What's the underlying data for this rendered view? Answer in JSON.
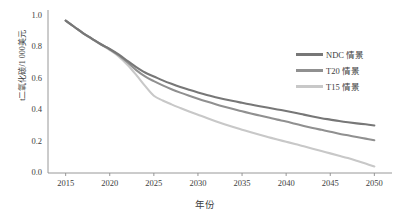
{
  "chart_data": {
    "type": "line",
    "title": "",
    "xlabel": "年份",
    "ylabel": "t二氧化碳/1 000美元",
    "xlim": [
      2013,
      2052
    ],
    "ylim": [
      0.0,
      1.0
    ],
    "grid": false,
    "legend_position": "upper-right",
    "x_ticks": [
      "2015",
      "2020",
      "2025",
      "2030",
      "2035",
      "2040",
      "2045",
      "2050"
    ],
    "y_ticks": [
      "0.0",
      "0.2",
      "0.4",
      "0.6",
      "0.8",
      "1.0"
    ],
    "x": [
      2015,
      2016,
      2017,
      2018,
      2019,
      2020,
      2021,
      2022,
      2023,
      2024,
      2025,
      2026,
      2027,
      2028,
      2029,
      2030,
      2031,
      2032,
      2033,
      2034,
      2035,
      2036,
      2037,
      2038,
      2039,
      2040,
      2041,
      2042,
      2043,
      2044,
      2045,
      2046,
      2047,
      2048,
      2049,
      2050
    ],
    "series": [
      {
        "name": "NDC 情景",
        "color": "#777777",
        "values": [
          0.97,
          0.93,
          0.89,
          0.855,
          0.82,
          0.79,
          0.755,
          0.715,
          0.675,
          0.64,
          0.615,
          0.59,
          0.568,
          0.548,
          0.53,
          0.513,
          0.497,
          0.483,
          0.47,
          0.458,
          0.447,
          0.436,
          0.425,
          0.415,
          0.405,
          0.395,
          0.384,
          0.372,
          0.36,
          0.349,
          0.34,
          0.331,
          0.323,
          0.316,
          0.31,
          0.303
        ]
      },
      {
        "name": "T20 情景",
        "color": "#909090",
        "values": [
          0.97,
          0.93,
          0.89,
          0.855,
          0.82,
          0.788,
          0.75,
          0.705,
          0.655,
          0.615,
          0.585,
          0.558,
          0.534,
          0.512,
          0.492,
          0.473,
          0.455,
          0.438,
          0.422,
          0.407,
          0.393,
          0.379,
          0.366,
          0.353,
          0.34,
          0.328,
          0.314,
          0.3,
          0.287,
          0.275,
          0.263,
          0.25,
          0.24,
          0.229,
          0.219,
          0.209
        ]
      },
      {
        "name": "T15 情景",
        "color": "#c8c8c8",
        "values": [
          0.97,
          0.93,
          0.89,
          0.853,
          0.818,
          0.783,
          0.743,
          0.69,
          0.625,
          0.555,
          0.492,
          0.462,
          0.437,
          0.414,
          0.392,
          0.371,
          0.35,
          0.33,
          0.311,
          0.293,
          0.276,
          0.259,
          0.243,
          0.228,
          0.213,
          0.199,
          0.185,
          0.17,
          0.155,
          0.14,
          0.125,
          0.11,
          0.095,
          0.078,
          0.06,
          0.042
        ]
      }
    ],
    "axis_color": "#8c8c8c"
  }
}
